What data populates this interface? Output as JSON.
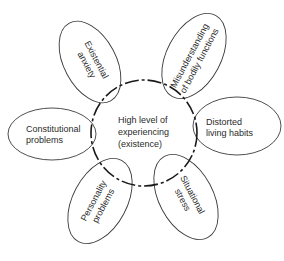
{
  "diagram": {
    "type": "petal",
    "center": {
      "lines": [
        "High level of",
        "experiencing",
        "(existence)"
      ]
    },
    "petals": [
      {
        "id": "existential-anxiety",
        "lines": [
          "Existential",
          "anxiety"
        ],
        "position": "upper-left"
      },
      {
        "id": "misunderstanding-bodily-functions",
        "lines": [
          "Misunderstanding",
          "of bodily functions"
        ],
        "position": "upper-right"
      },
      {
        "id": "constitutional-problems",
        "lines": [
          "Constitutional",
          "problems"
        ],
        "position": "left"
      },
      {
        "id": "distorted-living-habits",
        "lines": [
          "Distorted",
          "living habits"
        ],
        "position": "right"
      },
      {
        "id": "personality-problems",
        "lines": [
          "Personality",
          "problems"
        ],
        "position": "lower-left"
      },
      {
        "id": "situational-stress",
        "lines": [
          "Situational",
          "stress"
        ],
        "position": "lower-right"
      }
    ]
  }
}
